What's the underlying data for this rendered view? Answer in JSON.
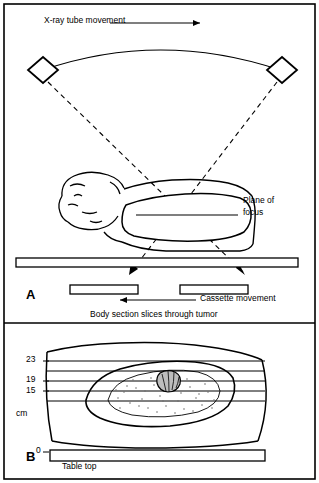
{
  "figure": {
    "panels": [
      {
        "id": "A",
        "label": "A"
      },
      {
        "id": "B",
        "label": "B"
      }
    ],
    "labels": {
      "tube_movement": "X-ray tube movement",
      "plane_of_focus_line1": "Plane of",
      "plane_of_focus_line2": "focus",
      "cassette_movement": "Cassette movement",
      "body_section": "Body section slices through tumor",
      "table_top": "Table top",
      "cm_unit": "cm"
    },
    "scale_ticks": [
      "23",
      "19",
      "15",
      "0"
    ],
    "colors": {
      "stroke": "#000000",
      "background": "#ffffff",
      "border": "#000000",
      "tumor_fill": "#b8b8b8",
      "stipple": "#7a7a7a"
    }
  }
}
